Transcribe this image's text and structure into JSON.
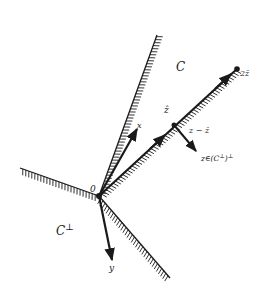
{
  "diagram": {
    "type": "convex-cone-projection",
    "origin_label": "0",
    "regions": {
      "cone": "C",
      "polar_cone": "C",
      "polar_cone_sup": "⊥"
    },
    "vectors": {
      "x": "x",
      "y": "y",
      "z_hat": "ẑ",
      "two_z_hat": "2ẑ",
      "z_minus_z_hat": "z − ẑ",
      "z_member_prefix": "z∈(C",
      "z_member_sup1": "⊥",
      "z_member_mid": ")",
      "z_member_sup2": "⊥"
    },
    "colors": {
      "ink": "#1a1a1a",
      "background": "#ffffff"
    }
  }
}
